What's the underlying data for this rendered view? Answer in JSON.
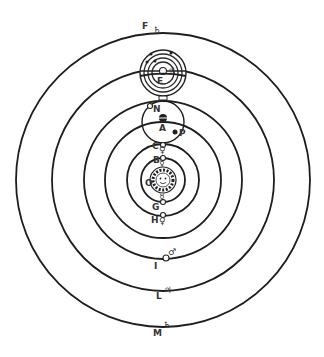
{
  "diagram": {
    "type": "heliocentric planetary system with moons",
    "center": {
      "x": 163,
      "y": 180
    },
    "sun": {
      "name": "sun",
      "radius": 13,
      "label": "O"
    },
    "orbits": [
      {
        "name": "mercury",
        "radius": 22,
        "labels": [
          "B",
          "G"
        ],
        "symbol": "☿"
      },
      {
        "name": "venus",
        "radius": 36,
        "labels": [
          "C",
          "H"
        ],
        "symbol": "♀"
      },
      {
        "name": "earth",
        "radius": 58,
        "label": "A",
        "symbol": "⊕"
      },
      {
        "name": "mars",
        "radius": 79,
        "label": "I",
        "symbol": "♂"
      },
      {
        "name": "jupiter",
        "radius": 111,
        "labels": [
          "E",
          "L"
        ],
        "symbol": "♃"
      },
      {
        "name": "saturn",
        "radius": 147,
        "labels": [
          "F",
          "M"
        ],
        "symbol": "♄"
      }
    ],
    "moon_system": {
      "center_label": "A",
      "labels": [
        "N",
        "P"
      ],
      "radius": 21
    },
    "jupiter_moons": {
      "center_label": "E",
      "rings": [
        23,
        19,
        15,
        11
      ]
    },
    "labels": {
      "F": "F",
      "E": "E",
      "N": "N",
      "A": "A",
      "P": "P",
      "C": "C",
      "B": "B",
      "O": "O",
      "G": "G",
      "H": "H",
      "I": "I",
      "L": "L",
      "M": "M"
    },
    "symbols": {
      "saturn": "♄",
      "jupiter": "♃",
      "mars": "♂",
      "venus": "♀",
      "mercury": "☿"
    }
  }
}
